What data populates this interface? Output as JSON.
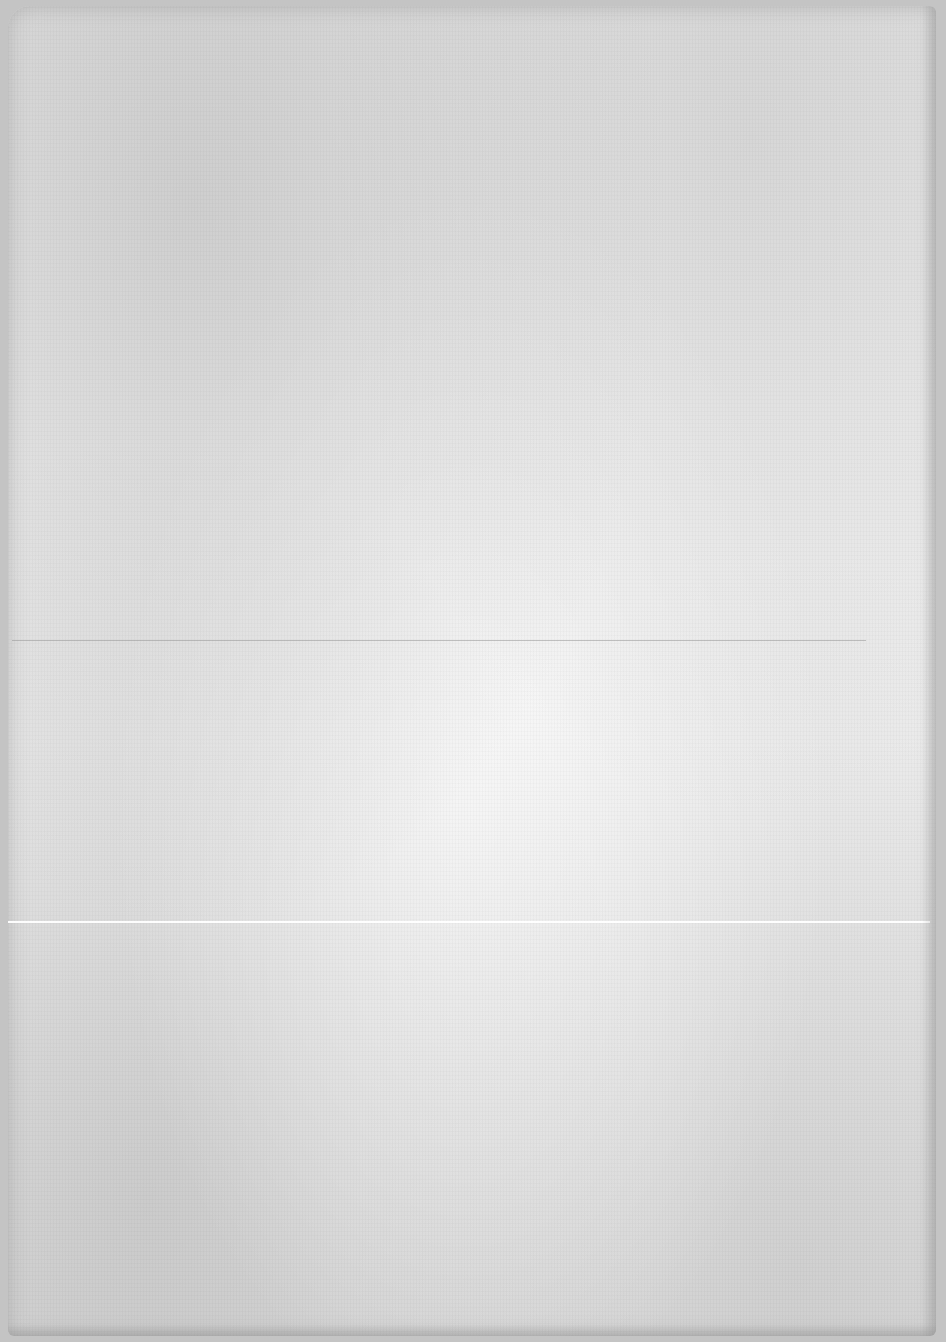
{
  "document": {
    "type": "blank-scanned-page",
    "text_content": "",
    "background_color": "#ececec",
    "border_color": "#c4c4c4",
    "features": {
      "fold_line_y": 640,
      "crease_line_y": 922
    }
  }
}
